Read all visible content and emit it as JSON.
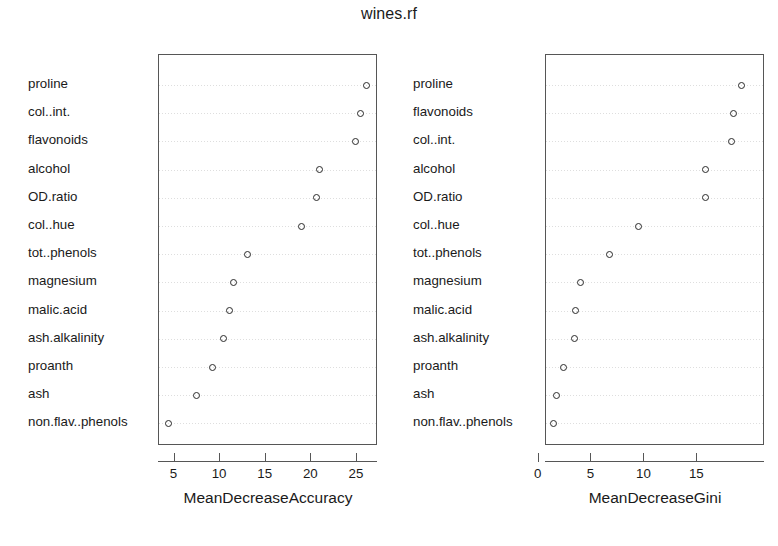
{
  "chart_data": {
    "type": "scatter",
    "title": "wines.rf",
    "subtitle": "",
    "layout": "two-panel variable importance dotchart",
    "grid": true,
    "legend": null,
    "panels": [
      {
        "id": "accuracy",
        "xlabel": "MeanDecreaseAccuracy",
        "ylabel": "",
        "xlim": [
          3.3,
          27.3
        ],
        "xticks": [
          5,
          10,
          15,
          20,
          25
        ],
        "xtick_labels": [
          "5",
          "10",
          "15",
          "20",
          "25"
        ],
        "categories": [
          "proline",
          "col..int.",
          "flavonoids",
          "alcohol",
          "OD.ratio",
          "col..hue",
          "tot..phenols",
          "magnesium",
          "malic.acid",
          "ash.alkalinity",
          "proanth",
          "ash",
          "non.flav..phenols"
        ],
        "values": [
          26.0,
          25.4,
          24.8,
          20.9,
          20.6,
          18.9,
          13.0,
          11.5,
          11.0,
          10.4,
          9.2,
          7.4,
          4.3
        ]
      },
      {
        "id": "gini",
        "xlabel": "MeanDecreaseGini",
        "ylabel": "",
        "xlim": [
          0.7,
          21.4
        ],
        "xticks": [
          0,
          5,
          10,
          15
        ],
        "xtick_labels": [
          "0",
          "5",
          "10",
          "15"
        ],
        "categories": [
          "proline",
          "flavonoids",
          "col..int.",
          "alcohol",
          "OD.ratio",
          "col..hue",
          "tot..phenols",
          "magnesium",
          "malic.acid",
          "ash.alkalinity",
          "proanth",
          "ash",
          "non.flav..phenols"
        ],
        "values": [
          19.2,
          18.4,
          18.2,
          15.8,
          15.8,
          9.4,
          6.7,
          4.0,
          3.5,
          3.4,
          2.4,
          1.7,
          1.4
        ]
      }
    ],
    "colors": {
      "point_stroke": "#2a2a2a",
      "frame": "#565656",
      "gridline": "#d8d8d8",
      "text": "#1a1a1a",
      "background": "#ffffff"
    }
  }
}
